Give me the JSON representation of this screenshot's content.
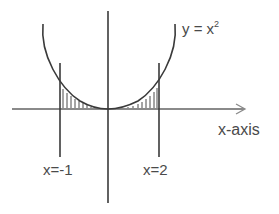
{
  "figure": {
    "type": "area-under-curve diagram",
    "curve_label": {
      "base": "y = x",
      "exponent": "2"
    },
    "axis_label": "x-axis",
    "bounds": [
      {
        "label": "x=-1",
        "value": -1
      },
      {
        "label": "x=2",
        "value": 2
      }
    ],
    "shaded_region": "area between y = x^2 and the x-axis from x=-1 to x=2",
    "colors": {
      "stroke": "#3a3a3a",
      "text": "#4a4a4a",
      "background": "#ffffff"
    }
  }
}
